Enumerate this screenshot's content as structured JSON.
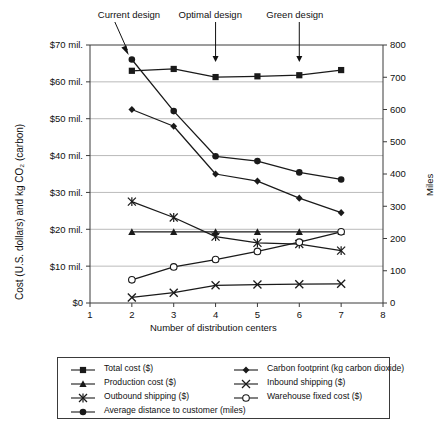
{
  "chart_data": {
    "type": "line",
    "title": "",
    "xlabel": "Number of distribution centers",
    "ylabel": "Cost (U.S. dollars) and kg CO₂ (carbon)",
    "ylabel_right": "Miles",
    "x": [
      2,
      3,
      4,
      5,
      6,
      7
    ],
    "xlim": [
      1,
      8
    ],
    "xticks": [
      "1",
      "2",
      "3",
      "4",
      "5",
      "6",
      "7",
      "8"
    ],
    "ylim": [
      0,
      70000000
    ],
    "yticks": [
      "$0",
      "$10 mil.",
      "$20 mil.",
      "$30 mil.",
      "$40 mil.",
      "$50 mil.",
      "$60 mil.",
      "$70 mil."
    ],
    "ylim_right": [
      0,
      800
    ],
    "yticks_right": [
      "0",
      "100",
      "200",
      "300",
      "400",
      "500",
      "600",
      "700",
      "800"
    ],
    "grid": true,
    "legend_position": "bottom",
    "series": [
      {
        "name": "Total cost ($)",
        "marker": "square",
        "axis": "left",
        "values": [
          63.0,
          63.5,
          61.3,
          61.5,
          61.8,
          63.2
        ],
        "units": "millions of dollars"
      },
      {
        "name": "Production cost ($)",
        "marker": "triangle",
        "axis": "left",
        "values": [
          19.3,
          19.3,
          19.3,
          19.3,
          19.3,
          19.3
        ],
        "units": "millions of dollars"
      },
      {
        "name": "Outbound shipping ($)",
        "marker": "star",
        "axis": "left",
        "values": [
          27.5,
          23.2,
          18.0,
          16.3,
          16.0,
          14.2
        ],
        "units": "millions of dollars"
      },
      {
        "name": "Average distance to customer (miles)",
        "marker": "filled-circle",
        "axis": "right",
        "values": [
          755,
          595,
          455,
          440,
          405,
          383
        ],
        "units": "miles"
      },
      {
        "name": "Carbon footprint (kg carbon dioxide)",
        "marker": "diamond",
        "axis": "right",
        "values": [
          600,
          548,
          400,
          378,
          325,
          280
        ],
        "units": "kg carbon dioxide"
      },
      {
        "name": "Inbound shipping ($)",
        "marker": "cross",
        "axis": "left",
        "values": [
          1.5,
          2.8,
          4.8,
          5.0,
          5.1,
          5.2
        ],
        "units": "millions of dollars"
      },
      {
        "name": "Warehouse fixed cost ($)",
        "marker": "open-circle",
        "axis": "left",
        "values": [
          6.3,
          9.8,
          11.8,
          14.0,
          16.5,
          19.3
        ],
        "units": "millions of dollars"
      }
    ],
    "annotations": [
      {
        "label": "Current design",
        "at_x": 2
      },
      {
        "label": "Optimal design",
        "at_x": 4
      },
      {
        "label": "Green design",
        "at_x": 6
      }
    ]
  },
  "axes": {
    "left_title": "Cost (U.S. dollars) and kg CO₂ (carbon)",
    "right_title": "Miles",
    "bottom_title": "Number of distribution centers"
  },
  "legend": {
    "items": [
      {
        "label": "Total cost ($)",
        "marker": "square"
      },
      {
        "label": "Carbon footprint (kg carbon dioxide)",
        "marker": "diamond"
      },
      {
        "label": "Production cost ($)",
        "marker": "triangle"
      },
      {
        "label": "Inbound shipping ($)",
        "marker": "cross"
      },
      {
        "label": "Outbound shipping ($)",
        "marker": "star"
      },
      {
        "label": "Warehouse fixed cost ($)",
        "marker": "open-circle"
      },
      {
        "label": "Average distance to customer (miles)",
        "marker": "filled-circle"
      }
    ]
  },
  "colors": {
    "line": "#1a1a1a",
    "grid": "#a8a8a8",
    "axis": "#3a3a3a",
    "background": "#ffffff"
  }
}
